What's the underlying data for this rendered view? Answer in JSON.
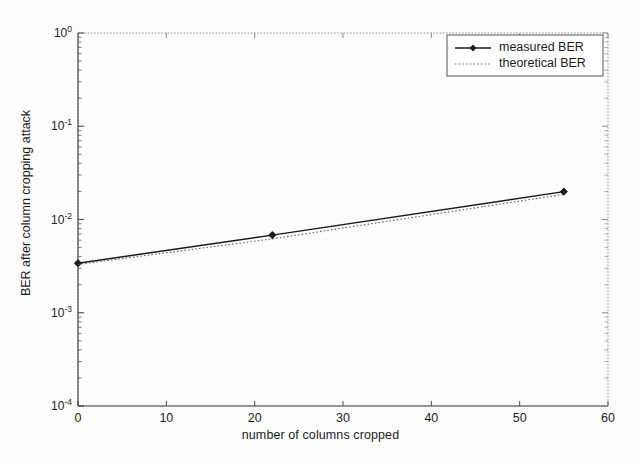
{
  "chart_data": {
    "type": "line",
    "title": "",
    "xlabel": "number of columns cropped",
    "ylabel": "BER after column cropping attack",
    "xlim": [
      0,
      60
    ],
    "ylim": [
      0.0001,
      1
    ],
    "yscale": "log",
    "grid": false,
    "legend_position": "top-right",
    "xticks": [
      0,
      10,
      20,
      30,
      40,
      50,
      60
    ],
    "xtick_labels": [
      "0",
      "10",
      "20",
      "30",
      "40",
      "50",
      "60"
    ],
    "yticks": [
      0.0001,
      0.001,
      0.01,
      0.1,
      1
    ],
    "ytick_labels": [
      "10-4",
      "10-3",
      "10-2",
      "10-1",
      "10 0"
    ],
    "ytick_mantissa": [
      "10",
      "10",
      "10",
      "10",
      "10"
    ],
    "ytick_exponent": [
      "-4",
      "-3",
      "-2",
      "-1",
      "0"
    ],
    "series": [
      {
        "name": "measured BER",
        "style": "solid-with-markers",
        "marker": "diamond",
        "color": "#1a1a1a",
        "x": [
          0,
          22,
          55
        ],
        "y": [
          0.0034,
          0.0068,
          0.0199
        ]
      },
      {
        "name": "theoretical BER",
        "style": "dotted",
        "marker": "none",
        "color": "#5a5a5a",
        "x": [
          0,
          22,
          55
        ],
        "y": [
          0.0033,
          0.0062,
          0.0186
        ]
      }
    ]
  },
  "legend": {
    "items": [
      {
        "label": "measured BER"
      },
      {
        "label": "theoretical BER"
      }
    ]
  }
}
